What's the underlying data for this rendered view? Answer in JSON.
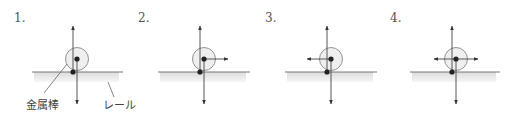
{
  "diagram": {
    "type": "force-diagram-options",
    "colors": {
      "line": "#444444",
      "circle_stroke": "#888888",
      "circle_fill": "#ececec",
      "rail_shade": "#e6e6e6",
      "dot": "#222222"
    },
    "labels": {
      "rod": "金属棒",
      "rail": "レール"
    },
    "panels": [
      {
        "number": "1.",
        "num_x": 14,
        "cx": 77,
        "cy": 59,
        "r": 11.5,
        "contact_x": 73,
        "rail_y": 72,
        "rail_x1": 32,
        "rail_x2": 123,
        "up_x": 73,
        "up_tip": 26,
        "down_x": 77,
        "down_tip": 104,
        "horizontal_arrows": []
      },
      {
        "number": "2.",
        "num_x": 138,
        "cx": 204,
        "cy": 59,
        "r": 11.5,
        "contact_x": 200,
        "rail_y": 72,
        "rail_x1": 158,
        "rail_x2": 250,
        "up_x": 200,
        "up_tip": 26,
        "down_x": 204,
        "down_tip": 104,
        "horizontal_arrows": [
          "right"
        ],
        "arrow_len": 24
      },
      {
        "number": "3.",
        "num_x": 265,
        "cx": 331,
        "cy": 59,
        "r": 11.5,
        "contact_x": 327,
        "rail_y": 72,
        "rail_x1": 285,
        "rail_x2": 377,
        "up_x": 327,
        "up_tip": 26,
        "down_x": 331,
        "down_tip": 104,
        "horizontal_arrows": [
          "left"
        ],
        "arrow_len": 24
      },
      {
        "number": "4.",
        "num_x": 390,
        "cx": 456,
        "cy": 59,
        "r": 11.5,
        "contact_x": 452,
        "rail_y": 72,
        "rail_x1": 410,
        "rail_x2": 500,
        "up_x": 452,
        "up_tip": 26,
        "down_x": 456,
        "down_tip": 104,
        "horizontal_arrows": [
          "left",
          "right"
        ],
        "arrow_len": 22
      }
    ]
  }
}
